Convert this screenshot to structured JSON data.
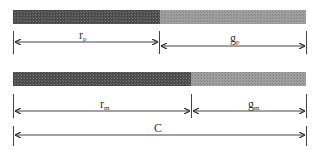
{
  "diagram": {
    "colors": {
      "red_segment": "#505050",
      "green_segment": "#9a9a9a",
      "line": "#444444"
    },
    "top_bar": {
      "x_start": 13,
      "x_split": 160,
      "x_end": 306,
      "y": 10,
      "height": 14,
      "red_label": {
        "main": "r",
        "sub": "p"
      },
      "green_label": {
        "main": "g",
        "sub": "p"
      }
    },
    "bottom_bar": {
      "x_start": 13,
      "x_split": 191,
      "x_end": 306,
      "y": 72,
      "height": 14,
      "red_label": {
        "main": "r",
        "sub": "m"
      },
      "green_label": {
        "main": "g",
        "sub": "m"
      }
    },
    "cycle_label": {
      "main": "C"
    }
  }
}
